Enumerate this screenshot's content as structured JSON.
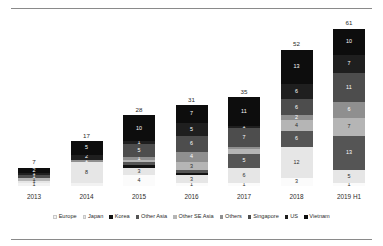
{
  "chart_data": {
    "type": "bar",
    "stacked": true,
    "title": "",
    "subtitle": "",
    "xlabel": "",
    "ylabel": "",
    "grid": false,
    "legend_position": "bottom",
    "ylim": [
      0,
      61
    ],
    "categories": [
      "2013",
      "2014",
      "2015",
      "2016",
      "2017",
      "2018",
      "2019 H1"
    ],
    "totals": [
      7,
      17,
      28,
      31,
      35,
      52,
      61
    ],
    "series": [
      {
        "name": "Vietnam",
        "color": "#0d0d0d",
        "values": [
          2,
          5,
          10,
          7,
          11,
          13,
          10
        ]
      },
      {
        "name": "US",
        "color": "#1f1f1f",
        "values": [
          1,
          2,
          1,
          5,
          1,
          6,
          7
        ]
      },
      {
        "name": "Singapore",
        "color": "#4d4d4d",
        "values": [
          1,
          0,
          5,
          6,
          7,
          6,
          11
        ]
      },
      {
        "name": "Others",
        "color": "#8f8f8f",
        "values": [
          0,
          0,
          1,
          4,
          1,
          2,
          6
        ]
      },
      {
        "name": "Other SE Asia",
        "color": "#b5b5b5",
        "values": [
          1,
          0,
          1,
          3,
          1,
          4,
          7
        ]
      },
      {
        "name": "Other Asia",
        "color": "#555555",
        "values": [
          0,
          0,
          1,
          1,
          5,
          6,
          13
        ]
      },
      {
        "name": "Korea",
        "color": "#121212",
        "values": [
          0,
          0,
          1,
          1,
          0,
          0,
          0
        ]
      },
      {
        "name": "Japan",
        "color": "#e6e6e6",
        "values": [
          1,
          8,
          3,
          3,
          6,
          12,
          5
        ]
      },
      {
        "name": "Europe",
        "color": "#f2f2f2",
        "values": [
          1,
          2,
          4,
          1,
          1,
          3,
          1
        ]
      }
    ]
  },
  "legend": {
    "items": [
      {
        "label": "Europe",
        "color": "#f2f2f2"
      },
      {
        "label": "Japan",
        "color": "#e6e6e6"
      },
      {
        "label": "Korea",
        "color": "#121212"
      },
      {
        "label": "Other Asia",
        "color": "#555555"
      },
      {
        "label": "Other SE Asia",
        "color": "#b5b5b5"
      },
      {
        "label": "Others",
        "color": "#8f8f8f"
      },
      {
        "label": "Singapore",
        "color": "#4d4d4d"
      },
      {
        "label": "US",
        "color": "#1f1f1f"
      },
      {
        "label": "Vietnam",
        "color": "#0d0d0d"
      }
    ]
  },
  "bars": [
    {
      "category": "2013",
      "total": "7",
      "segments": [
        {
          "series": "Vietnam",
          "value": 2,
          "label": "2",
          "color": "#0d0d0d",
          "text": "#ffffff",
          "show": true
        },
        {
          "series": "US",
          "value": 1,
          "label": "1",
          "color": "#1f1f1f",
          "text": "#ffffff",
          "show": true
        },
        {
          "series": "Singapore",
          "value": 1,
          "label": "1",
          "color": "#4d4d4d",
          "text": "#ffffff",
          "show": true
        },
        {
          "series": "Other SE Asia",
          "value": 1,
          "label": "1",
          "color": "#b5b5b5",
          "text": "#2b2b2b",
          "show": true
        },
        {
          "series": "Japan",
          "value": 1,
          "label": "1",
          "color": "#e6e6e6",
          "text": "#2b2b2b",
          "show": true
        },
        {
          "series": "Europe",
          "value": 1,
          "label": "1",
          "color": "#f2f2f2",
          "text": "#2b2b2b",
          "show": true
        }
      ]
    },
    {
      "category": "2014",
      "total": "17",
      "segments": [
        {
          "series": "Vietnam",
          "value": 5,
          "label": "5",
          "color": "#0d0d0d",
          "text": "#ffffff",
          "show": true
        },
        {
          "series": "US",
          "value": 2,
          "label": "2",
          "color": "#1f1f1f",
          "text": "#ffffff",
          "show": true
        },
        {
          "series": "Others",
          "value": 1,
          "label": "1",
          "color": "#8f8f8f",
          "text": "#ffffff",
          "show": true
        },
        {
          "series": "Japan",
          "value": 8,
          "label": "8",
          "color": "#e6e6e6",
          "text": "#2b2b2b",
          "show": true
        },
        {
          "series": "Europe",
          "value": 1,
          "label": "1",
          "color": "#f2f2f2",
          "text": "#2b2b2b",
          "show": false
        }
      ]
    },
    {
      "category": "2015",
      "total": "28",
      "segments": [
        {
          "series": "Vietnam",
          "value": 10,
          "label": "10",
          "color": "#0d0d0d",
          "text": "#ffffff",
          "show": true
        },
        {
          "series": "US",
          "value": 1,
          "label": "1",
          "color": "#1f1f1f",
          "text": "#ffffff",
          "show": true
        },
        {
          "series": "Singapore",
          "value": 5,
          "label": "5",
          "color": "#4d4d4d",
          "text": "#ffffff",
          "show": true
        },
        {
          "series": "Others",
          "value": 1,
          "label": "1",
          "color": "#8f8f8f",
          "text": "#ffffff",
          "show": true
        },
        {
          "series": "Other SE Asia",
          "value": 1,
          "label": "1",
          "color": "#b5b5b5",
          "text": "#2b2b2b",
          "show": false
        },
        {
          "series": "Other Asia",
          "value": 1,
          "label": "1",
          "color": "#555555",
          "text": "#ffffff",
          "show": false
        },
        {
          "series": "Korea",
          "value": 1,
          "label": "1",
          "color": "#121212",
          "text": "#ffffff",
          "show": false
        },
        {
          "series": "Japan",
          "value": 3,
          "label": "3",
          "color": "#e6e6e6",
          "text": "#2b2b2b",
          "show": true
        },
        {
          "series": "Europe",
          "value": 4,
          "label": "4",
          "color": "#fbfbfb",
          "text": "#2b2b2b",
          "show": true
        }
      ]
    },
    {
      "category": "2016",
      "total": "31",
      "segments": [
        {
          "series": "Vietnam",
          "value": 7,
          "label": "7",
          "color": "#0d0d0d",
          "text": "#ffffff",
          "show": true
        },
        {
          "series": "US",
          "value": 5,
          "label": "5",
          "color": "#1f1f1f",
          "text": "#ffffff",
          "show": true
        },
        {
          "series": "Singapore",
          "value": 6,
          "label": "6",
          "color": "#4d4d4d",
          "text": "#ffffff",
          "show": true
        },
        {
          "series": "Others",
          "value": 4,
          "label": "4",
          "color": "#8f8f8f",
          "text": "#ffffff",
          "show": true
        },
        {
          "series": "Other SE Asia",
          "value": 3,
          "label": "3",
          "color": "#b5b5b5",
          "text": "#2b2b2b",
          "show": true
        },
        {
          "series": "Other Asia",
          "value": 1,
          "label": "1",
          "color": "#555555",
          "text": "#ffffff",
          "show": false
        },
        {
          "series": "Korea",
          "value": 1,
          "label": "1",
          "color": "#121212",
          "text": "#ffffff",
          "show": false
        },
        {
          "series": "Japan",
          "value": 3,
          "label": "3",
          "color": "#e6e6e6",
          "text": "#2b2b2b",
          "show": true
        },
        {
          "series": "Europe",
          "value": 1,
          "label": "1",
          "color": "#fbfbfb",
          "text": "#2b2b2b",
          "show": true
        }
      ]
    },
    {
      "category": "2017",
      "total": "35",
      "segments": [
        {
          "series": "Vietnam",
          "value": 11,
          "label": "11",
          "color": "#0d0d0d",
          "text": "#ffffff",
          "show": true
        },
        {
          "series": "US",
          "value": 1,
          "label": "1",
          "color": "#1f1f1f",
          "text": "#ffffff",
          "show": true
        },
        {
          "series": "Singapore",
          "value": 7,
          "label": "7",
          "color": "#4d4d4d",
          "text": "#ffffff",
          "show": true
        },
        {
          "series": "Others",
          "value": 1,
          "label": "1",
          "color": "#8f8f8f",
          "text": "#ffffff",
          "show": false
        },
        {
          "series": "Other SE Asia",
          "value": 2,
          "label": "2",
          "color": "#b5b5b5",
          "text": "#2b2b2b",
          "show": false
        },
        {
          "series": "Other Asia",
          "value": 5,
          "label": "5",
          "color": "#555555",
          "text": "#ffffff",
          "show": true
        },
        {
          "series": "Japan",
          "value": 6,
          "label": "6",
          "color": "#e6e6e6",
          "text": "#2b2b2b",
          "show": true
        },
        {
          "series": "Europe",
          "value": 1,
          "label": "1",
          "color": "#fbfbfb",
          "text": "#2b2b2b",
          "show": true
        }
      ]
    },
    {
      "category": "2018",
      "total": "52",
      "segments": [
        {
          "series": "Vietnam",
          "value": 13,
          "label": "13",
          "color": "#0d0d0d",
          "text": "#ffffff",
          "show": true
        },
        {
          "series": "US",
          "value": 6,
          "label": "6",
          "color": "#1f1f1f",
          "text": "#ffffff",
          "show": true
        },
        {
          "series": "Singapore",
          "value": 6,
          "label": "6",
          "color": "#4d4d4d",
          "text": "#ffffff",
          "show": true
        },
        {
          "series": "Others",
          "value": 2,
          "label": "2",
          "color": "#8f8f8f",
          "text": "#ffffff",
          "show": true
        },
        {
          "series": "Other SE Asia",
          "value": 4,
          "label": "4",
          "color": "#b5b5b5",
          "text": "#2b2b2b",
          "show": true
        },
        {
          "series": "Other Asia",
          "value": 6,
          "label": "6",
          "color": "#555555",
          "text": "#ffffff",
          "show": true
        },
        {
          "series": "Japan",
          "value": 12,
          "label": "12",
          "color": "#e6e6e6",
          "text": "#2b2b2b",
          "show": true
        },
        {
          "series": "Europe",
          "value": 3,
          "label": "3",
          "color": "#fbfbfb",
          "text": "#2b2b2b",
          "show": true
        }
      ]
    },
    {
      "category": "2019 H1",
      "total": "61",
      "segments": [
        {
          "series": "Vietnam",
          "value": 10,
          "label": "10",
          "color": "#0d0d0d",
          "text": "#ffffff",
          "show": true
        },
        {
          "series": "US",
          "value": 7,
          "label": "7",
          "color": "#1f1f1f",
          "text": "#ffffff",
          "show": true
        },
        {
          "series": "Singapore",
          "value": 11,
          "label": "11",
          "color": "#4d4d4d",
          "text": "#ffffff",
          "show": true
        },
        {
          "series": "Others",
          "value": 6,
          "label": "6",
          "color": "#8f8f8f",
          "text": "#ffffff",
          "show": true
        },
        {
          "series": "Other SE Asia",
          "value": 7,
          "label": "7",
          "color": "#b5b5b5",
          "text": "#2b2b2b",
          "show": true
        },
        {
          "series": "Other Asia",
          "value": 13,
          "label": "13",
          "color": "#555555",
          "text": "#ffffff",
          "show": true
        },
        {
          "series": "Japan",
          "value": 5,
          "label": "5",
          "color": "#e6e6e6",
          "text": "#2b2b2b",
          "show": true
        },
        {
          "series": "Europe",
          "value": 1,
          "label": "1",
          "color": "#fbfbfb",
          "text": "#2b2b2b",
          "show": true
        }
      ]
    }
  ]
}
